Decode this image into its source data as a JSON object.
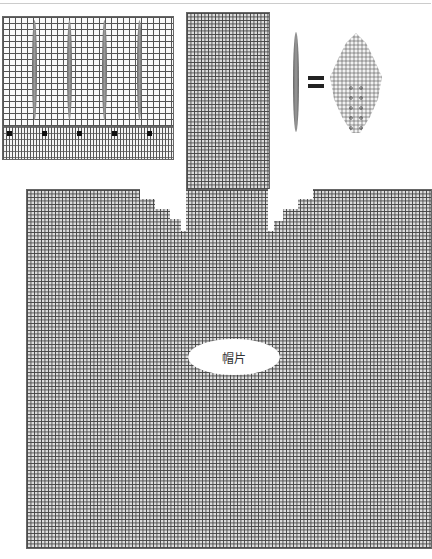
{
  "diagram": {
    "type": "knitting-chart",
    "label": "帽片",
    "legend": {
      "left_symbol": "elongated leaf motif",
      "equals": "=",
      "right_symbol": "diamond leaf chart"
    },
    "sections": [
      {
        "name": "top-left swatch",
        "desc": "5 panels with vertical leaf motifs and ribbing with black markers"
      },
      {
        "name": "center strip",
        "desc": "vertical strip of grid"
      },
      {
        "name": "main body",
        "desc": "hat piece grid with stepped shoulders and label"
      }
    ],
    "colors": {
      "grid": "#555555",
      "marker": "#111111",
      "background": "#ffffff"
    }
  }
}
